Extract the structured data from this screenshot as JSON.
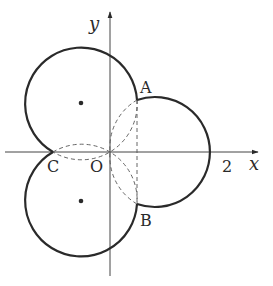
{
  "diagram": {
    "axes": {
      "x_label": "x",
      "y_label": "y"
    },
    "points": {
      "A": "A",
      "B": "B",
      "C": "C",
      "O": "O"
    },
    "tick_labels": {
      "x_2": "2"
    },
    "colors": {
      "stroke": "#2a2a2a",
      "background": "#ffffff"
    }
  }
}
